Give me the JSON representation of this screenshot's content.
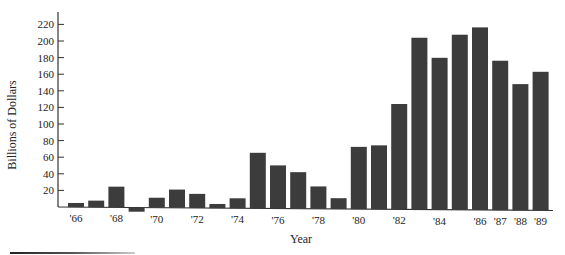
{
  "chart_data": {
    "type": "bar",
    "title": "",
    "xlabel": "Year",
    "ylabel": "Billions of Dollars",
    "ylim": [
      -10,
      230
    ],
    "yticks": [
      20,
      40,
      60,
      80,
      100,
      120,
      140,
      160,
      180,
      200,
      220
    ],
    "categories": [
      "'66",
      "'67",
      "'68",
      "'69",
      "'70",
      "'71",
      "'72",
      "'73",
      "'74",
      "'75",
      "'76",
      "'77",
      "'78",
      "'79",
      "'80",
      "'81",
      "'82",
      "'83",
      "'84",
      "'85",
      "'86",
      "'87",
      "'88",
      "'89"
    ],
    "xtick_labels": {
      "'66": "'66",
      "'68": "'68",
      "'70": "'70",
      "'72": "'72",
      "'74": "'74",
      "'76": "'76",
      "'78": "'78",
      "'80": "'80",
      "'82": "'82",
      "'84": "'84",
      "'86": "'86",
      "'87": "'87",
      "'88": "'88",
      "'89": "'89"
    },
    "values": [
      5,
      8,
      25,
      -5,
      12,
      22,
      17,
      5,
      12,
      67,
      52,
      44,
      27,
      13,
      75,
      77,
      127,
      207,
      183,
      211,
      220,
      180,
      152,
      167
    ],
    "grid": false,
    "legend": null,
    "bar_color": "#3c3c3c"
  },
  "labels": {
    "ylabel": "Billions of Dollars",
    "xlabel": "Year"
  }
}
